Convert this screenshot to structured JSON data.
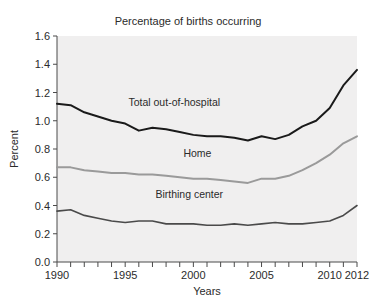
{
  "chart_data": {
    "type": "line",
    "title": "Percentage of births occurring\nout-of-hospital: United States, 1990-2012",
    "title_line1": "Percentage of births occurring",
    "title_line2": "out-of-hospital: United States, 1990-2012",
    "xlabel": "Years",
    "ylabel": "Percent",
    "xlim": [
      1990,
      2012
    ],
    "ylim": [
      0.0,
      1.6
    ],
    "grid": false,
    "legend_position": "inline-labels",
    "x": [
      1990,
      1991,
      1992,
      1993,
      1994,
      1995,
      1996,
      1997,
      1998,
      1999,
      2000,
      2001,
      2002,
      2003,
      2004,
      2005,
      2006,
      2007,
      2008,
      2009,
      2010,
      2011,
      2012
    ],
    "x_ticks": [
      1990,
      1991,
      1992,
      1993,
      1994,
      1995,
      1996,
      1997,
      1998,
      1999,
      2000,
      2001,
      2002,
      2003,
      2004,
      2005,
      2006,
      2007,
      2008,
      2009,
      2010,
      2011,
      2012
    ],
    "x_tick_labels": [
      {
        "value": 1990,
        "label": "1990"
      },
      {
        "value": 1995,
        "label": "1995"
      },
      {
        "value": 2000,
        "label": "2000"
      },
      {
        "value": 2005,
        "label": "2005"
      },
      {
        "value": 2010,
        "label": "2010"
      },
      {
        "value": 2012,
        "label": "2012"
      }
    ],
    "y_ticks": [
      0.0,
      0.2,
      0.4,
      0.6,
      0.8,
      1.0,
      1.2,
      1.4,
      1.6
    ],
    "y_tick_labels": [
      "0.0",
      "0.2",
      "0.4",
      "0.6",
      "0.8",
      "1.0",
      "1.2",
      "1.4",
      "1.6"
    ],
    "series": [
      {
        "name": "Total out-of-hospital",
        "color": "#1a1a1a",
        "width": 2.0,
        "label_x": 1998.6,
        "label_y": 1.105,
        "values": [
          1.12,
          1.11,
          1.06,
          1.03,
          1.0,
          0.98,
          0.93,
          0.95,
          0.94,
          0.92,
          0.9,
          0.89,
          0.89,
          0.88,
          0.86,
          0.89,
          0.87,
          0.9,
          0.96,
          1.0,
          1.09,
          1.25,
          1.36
        ]
      },
      {
        "name": "Home",
        "color": "#9a9a9a",
        "width": 2.0,
        "label_x": 2000.3,
        "label_y": 0.745,
        "values": [
          0.67,
          0.67,
          0.65,
          0.64,
          0.63,
          0.63,
          0.62,
          0.62,
          0.61,
          0.6,
          0.59,
          0.59,
          0.58,
          0.57,
          0.56,
          0.59,
          0.59,
          0.61,
          0.65,
          0.7,
          0.76,
          0.84,
          0.89
        ]
      },
      {
        "name": "Birthing center",
        "color": "#4a4a4a",
        "width": 1.6,
        "label_x": 1999.7,
        "label_y": 0.455,
        "values": [
          0.36,
          0.37,
          0.33,
          0.31,
          0.29,
          0.28,
          0.29,
          0.29,
          0.27,
          0.27,
          0.27,
          0.26,
          0.26,
          0.27,
          0.26,
          0.27,
          0.28,
          0.27,
          0.27,
          0.28,
          0.29,
          0.33,
          0.4
        ]
      }
    ],
    "plot_background": "#f0efef",
    "axis_color": "#4a4a4a"
  }
}
